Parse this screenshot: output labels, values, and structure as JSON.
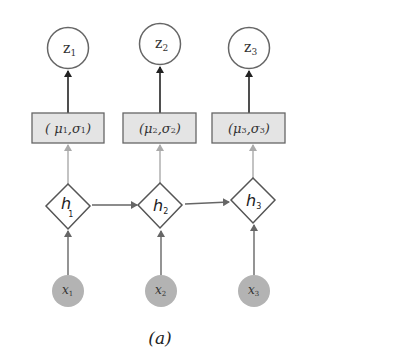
{
  "diagram": {
    "caption": "(a)",
    "colors": {
      "latent_stroke": "#666666",
      "box_fill": "#e4e4e4",
      "box_stroke": "#666666",
      "hidden_stroke": "#555555",
      "observed_fill": "#b3b3b3",
      "arrow_dark": "#222222",
      "arrow_light": "#aaaaaa",
      "arrow_mid": "#666666"
    },
    "latent_nodes": [
      {
        "id": "z1",
        "base": "z",
        "sub": "1"
      },
      {
        "id": "z2",
        "base": "z",
        "sub": "2"
      },
      {
        "id": "z3",
        "base": "z",
        "sub": "3"
      }
    ],
    "param_boxes": [
      {
        "id": "box1",
        "open": "( ",
        "mu": "μ",
        "mu_sub": "1",
        "sep": ",",
        "sigma": "σ",
        "sigma_sub": "1",
        "close": ")"
      },
      {
        "id": "box2",
        "open": "(",
        "mu": "μ",
        "mu_sub": "2",
        "sep": ",",
        "sigma": "σ",
        "sigma_sub": "2",
        "close": ")"
      },
      {
        "id": "box3",
        "open": "(",
        "mu": "μ",
        "mu_sub": "3",
        "sep": ",",
        "sigma": "σ",
        "sigma_sub": "3",
        "close": ")"
      }
    ],
    "hidden_nodes": [
      {
        "id": "h1",
        "base": "h",
        "sub": "1"
      },
      {
        "id": "h2",
        "base": "h",
        "sub": "2"
      },
      {
        "id": "h3",
        "base": "h",
        "sub": "3"
      }
    ],
    "observed_nodes": [
      {
        "id": "x1",
        "base": "x",
        "sub": "1"
      },
      {
        "id": "x2",
        "base": "x",
        "sub": "2"
      },
      {
        "id": "x3",
        "base": "x",
        "sub": "3"
      }
    ],
    "edges": [
      {
        "from": "x1",
        "to": "h1"
      },
      {
        "from": "x2",
        "to": "h2"
      },
      {
        "from": "x3",
        "to": "h3"
      },
      {
        "from": "h1",
        "to": "h2"
      },
      {
        "from": "h2",
        "to": "h3"
      },
      {
        "from": "h1",
        "to": "box1"
      },
      {
        "from": "h2",
        "to": "box2"
      },
      {
        "from": "h3",
        "to": "box3"
      },
      {
        "from": "box1",
        "to": "z1"
      },
      {
        "from": "box2",
        "to": "z2"
      },
      {
        "from": "box3",
        "to": "z3"
      }
    ]
  }
}
